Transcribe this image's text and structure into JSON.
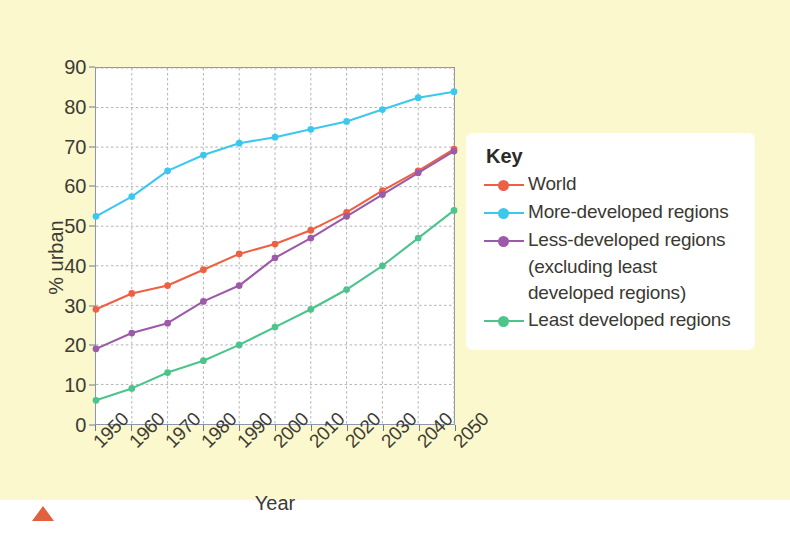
{
  "colors": {
    "background": "#fcf8cd",
    "plot_background": "#ffffff",
    "axis": "#8b97ab",
    "grid": "#a9a9a9",
    "world": "#ee6044",
    "more_developed": "#3cc8ee",
    "less_developed": "#9c5aa8",
    "least_developed": "#4cc48c",
    "marker_triangle": "#e0603f"
  },
  "legend": {
    "title": "Key",
    "items": [
      {
        "label": "World",
        "color": "#ee6044",
        "continuation": []
      },
      {
        "label": "More-developed regions",
        "color": "#3cc8ee",
        "continuation": []
      },
      {
        "label": "Less-developed regions",
        "color": "#9c5aa8",
        "continuation": [
          "(excluding least",
          "developed regions)"
        ]
      },
      {
        "label": "Least developed regions",
        "color": "#4cc48c",
        "continuation": []
      }
    ]
  },
  "chart_data": {
    "type": "line",
    "title": "",
    "xlabel": "Year",
    "ylabel": "% urban",
    "xlim": [
      1950,
      2050
    ],
    "ylim": [
      0,
      90
    ],
    "ytick_step": 10,
    "grid": true,
    "legend_position": "right",
    "x": [
      1950,
      1960,
      1970,
      1980,
      1990,
      2000,
      2010,
      2020,
      2030,
      2040,
      2050
    ],
    "categories": [
      "1950",
      "1960",
      "1970",
      "1980",
      "1990",
      "2000",
      "2010",
      "2020",
      "2030",
      "2040",
      "2050"
    ],
    "ytick_labels": [
      "0",
      "10",
      "20",
      "30",
      "40",
      "50",
      "60",
      "70",
      "80",
      "90"
    ],
    "series": [
      {
        "name": "World",
        "color": "#ee6044",
        "values": [
          29,
          33,
          35,
          39,
          43,
          45.5,
          49,
          53.5,
          59,
          64,
          69.5
        ]
      },
      {
        "name": "More-developed regions",
        "color": "#3cc8ee",
        "values": [
          52.5,
          57.5,
          64,
          68,
          71,
          72.5,
          74.5,
          76.5,
          79.5,
          82.5,
          84
        ]
      },
      {
        "name": "Less-developed regions (excluding least developed regions)",
        "color": "#9c5aa8",
        "values": [
          19,
          23,
          25.5,
          31,
          35,
          42,
          47,
          52.5,
          58,
          63.5,
          69
        ]
      },
      {
        "name": "Least developed regions",
        "color": "#4cc48c",
        "values": [
          6,
          9,
          13,
          16,
          20,
          24.5,
          29,
          34,
          40,
          47,
          54
        ]
      }
    ]
  }
}
